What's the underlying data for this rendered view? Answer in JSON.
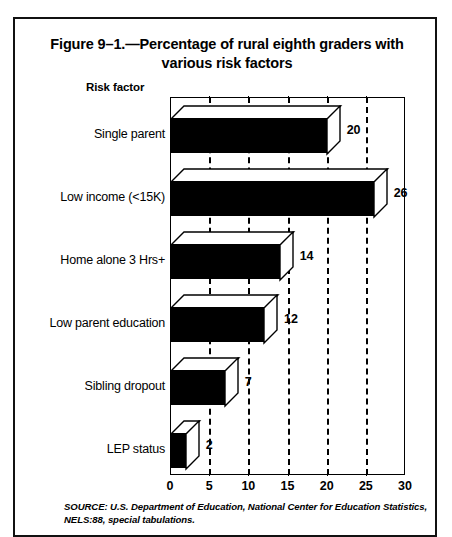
{
  "figure": {
    "title_line1": "Figure 9–1.—Percentage of rural eighth graders with",
    "title_line2": "various risk factors",
    "axis_caption": "Risk factor",
    "source_line1": "SOURCE: U.S. Department of Education, National Center for Education Statistics,",
    "source_line2": "NELS:88, special tabulations."
  },
  "chart_data": {
    "type": "bar",
    "orientation": "horizontal",
    "style": "3d-block",
    "title": "Figure 9–1.—Percentage of rural eighth graders with various risk factors",
    "xlabel": "",
    "ylabel": "Risk factor",
    "xlim": [
      0,
      30
    ],
    "xticks": [
      0,
      5,
      10,
      15,
      20,
      25,
      30
    ],
    "xtick_labels": [
      "0",
      "5",
      "10",
      "15",
      "20",
      "25",
      "30"
    ],
    "grid": "vertical-dashed",
    "legend": "none",
    "categories": [
      "Single parent",
      "Low income (<15K)",
      "Home alone 3 Hrs+",
      "Low parent education",
      "Sibling dropout",
      "LEP status"
    ],
    "values": [
      20,
      26,
      14,
      12,
      7,
      2
    ],
    "value_labels": [
      "20",
      "26",
      "14",
      "12",
      "7",
      "2"
    ],
    "bar_color": "#000000",
    "face_color": "#FFFFFF",
    "annotations": [
      "SOURCE: U.S. Department of Education, National Center for Education Statistics, NELS:88, special tabulations."
    ]
  }
}
